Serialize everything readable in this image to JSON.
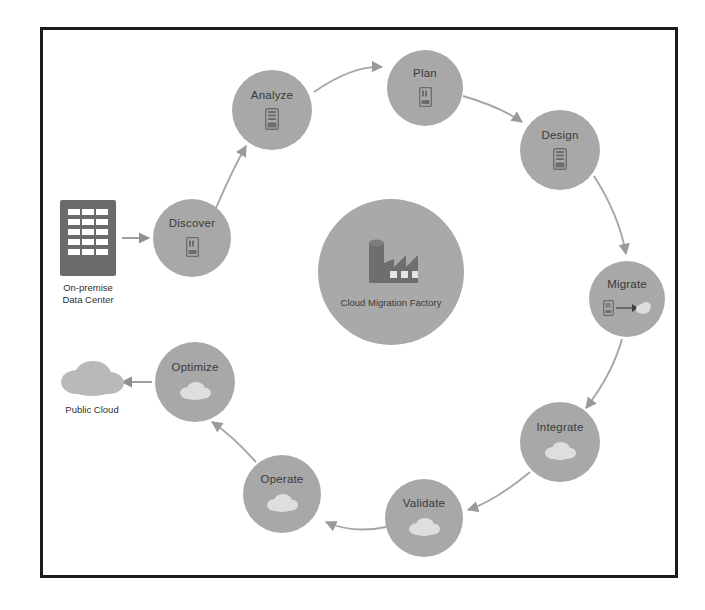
{
  "diagram": {
    "frame": {
      "stroke": "#1b1b1b"
    },
    "center": {
      "label": "Cloud Migration Factory",
      "icon": "factory-icon",
      "fill": "#a9a9a9",
      "icon_color": "#6e6e6e"
    },
    "node_fill": "#a8a8a8",
    "node_text_color": "#3a3a3a",
    "arrow_color": "#9a9a9a",
    "nodes": [
      {
        "id": "discover",
        "label": "Discover",
        "icon": "server-icon",
        "cx": 192,
        "cy": 238,
        "r": 39
      },
      {
        "id": "analyze",
        "label": "Analyze",
        "icon": "server-rack-icon",
        "cx": 272,
        "cy": 110,
        "r": 40
      },
      {
        "id": "plan",
        "label": "Plan",
        "icon": "server-icon",
        "cx": 425,
        "cy": 88,
        "r": 38
      },
      {
        "id": "design",
        "label": "Design",
        "icon": "server-rack-icon",
        "cx": 560,
        "cy": 150,
        "r": 40
      },
      {
        "id": "migrate",
        "label": "Migrate",
        "icon": "server-to-cloud-icon",
        "cx": 627,
        "cy": 299,
        "r": 38
      },
      {
        "id": "integrate",
        "label": "Integrate",
        "icon": "cloud-icon",
        "cx": 560,
        "cy": 442,
        "r": 40
      },
      {
        "id": "validate",
        "label": "Validate",
        "icon": "cloud-icon",
        "cx": 424,
        "cy": 518,
        "r": 39
      },
      {
        "id": "operate",
        "label": "Operate",
        "icon": "cloud-icon",
        "cx": 282,
        "cy": 494,
        "r": 39
      },
      {
        "id": "optimize",
        "label": "Optimize",
        "icon": "cloud-icon",
        "cx": 195,
        "cy": 382,
        "r": 40
      }
    ],
    "endpoints": [
      {
        "id": "on-premise-data-center",
        "label": "On-premise\nData Center",
        "icon": "datacenter-icon",
        "x": 88,
        "y": 278,
        "color": "#6b6b6b"
      },
      {
        "id": "public-cloud",
        "label": "Public Cloud",
        "icon": "cloud-icon",
        "x": 92,
        "y": 403,
        "color": "#b5b5b5"
      }
    ],
    "flow_order": [
      "Discover",
      "Analyze",
      "Plan",
      "Design",
      "Migrate",
      "Integrate",
      "Validate",
      "Operate",
      "Optimize"
    ]
  }
}
